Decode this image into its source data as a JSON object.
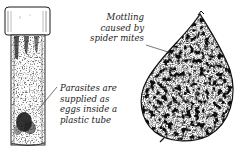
{
  "figure": {
    "tube": {
      "label_lines": [
        "Parasites are",
        "supplied as",
        "eggs inside a",
        "plastic tube"
      ]
    },
    "leaf": {
      "label_lines": [
        "Mottling",
        "caused by",
        "spider mites"
      ]
    },
    "colors": {
      "ink": "#1a1a1a",
      "background": "#ffffff",
      "leaf_mid": "#8a8a8a"
    }
  }
}
